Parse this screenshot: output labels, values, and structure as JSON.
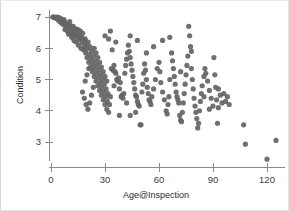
{
  "figure": {
    "background_color": "#ffffff",
    "border_color": "#dcdcdc",
    "width": 289,
    "height": 211
  },
  "axes": {
    "point_color": "#646464",
    "axis_color": "#8a8a8a",
    "label_color": "#2b2b2b",
    "x_title": "Age@Inspection",
    "y_title": "Condition"
  },
  "chart_data": {
    "type": "scatter",
    "title": "",
    "xlabel": "Age@Inspection",
    "ylabel": "Condition",
    "xlim": [
      -4,
      130
    ],
    "ylim": [
      2.3,
      7.25
    ],
    "xticks": [
      0,
      30,
      60,
      90,
      120
    ],
    "yticks": [
      3,
      4,
      5,
      6,
      7
    ],
    "xtick_labels": [
      "0",
      "30",
      "60",
      "90",
      "120"
    ],
    "ytick_labels": [
      "3",
      "4",
      "5",
      "6",
      "7"
    ],
    "grid": false,
    "legend": null,
    "marker": {
      "shape": "circle",
      "color": "#646464",
      "size_px": 5.2,
      "opacity": 0.92
    },
    "n_points": 231,
    "series": [
      {
        "name": "Bridge condition vs age",
        "points": [
          [
            1,
            7.0
          ],
          [
            1.5,
            7.0
          ],
          [
            2,
            6.98
          ],
          [
            2.5,
            7.0
          ],
          [
            3,
            6.95
          ],
          [
            3.5,
            7.0
          ],
          [
            4,
            6.9
          ],
          [
            4.5,
            6.98
          ],
          [
            5,
            6.85
          ],
          [
            5.5,
            6.95
          ],
          [
            6,
            6.8
          ],
          [
            6.5,
            6.88
          ],
          [
            7,
            6.75
          ],
          [
            7.2,
            6.92
          ],
          [
            7.8,
            6.6
          ],
          [
            8,
            6.82
          ],
          [
            8.5,
            6.7
          ],
          [
            9,
            6.55
          ],
          [
            9.3,
            6.78
          ],
          [
            9.8,
            6.45
          ],
          [
            10,
            6.65
          ],
          [
            10.4,
            6.85
          ],
          [
            10.8,
            6.5
          ],
          [
            11,
            6.72
          ],
          [
            11.5,
            6.35
          ],
          [
            11.8,
            6.6
          ],
          [
            12,
            6.45
          ],
          [
            12.4,
            6.7
          ],
          [
            12.8,
            6.25
          ],
          [
            13,
            6.55
          ],
          [
            13.3,
            6.4
          ],
          [
            13.8,
            6.62
          ],
          [
            14,
            6.2
          ],
          [
            14.3,
            6.48
          ],
          [
            14.8,
            6.35
          ],
          [
            15,
            6.6
          ],
          [
            15.3,
            6.1
          ],
          [
            15.7,
            6.42
          ],
          [
            16,
            6.28
          ],
          [
            16.3,
            6.55
          ],
          [
            16.7,
            6.0
          ],
          [
            17,
            6.35
          ],
          [
            17.3,
            6.18
          ],
          [
            17.6,
            6.48
          ],
          [
            18,
            5.95
          ],
          [
            18.3,
            6.25
          ],
          [
            18.6,
            6.05
          ],
          [
            19,
            6.3
          ],
          [
            19.3,
            5.85
          ],
          [
            19.6,
            6.12
          ],
          [
            20,
            5.7
          ],
          [
            20.3,
            5.98
          ],
          [
            20.6,
            6.2
          ],
          [
            21,
            5.55
          ],
          [
            21.3,
            5.8
          ],
          [
            21.6,
            6.05
          ],
          [
            22,
            5.4
          ],
          [
            22.3,
            5.65
          ],
          [
            22.6,
            5.9
          ],
          [
            23,
            5.25
          ],
          [
            23.3,
            5.5
          ],
          [
            23.6,
            5.75
          ],
          [
            24,
            5.1
          ],
          [
            24.3,
            5.35
          ],
          [
            24.6,
            5.6
          ],
          [
            25,
            4.95
          ],
          [
            25.3,
            5.2
          ],
          [
            25.6,
            5.45
          ],
          [
            26,
            4.8
          ],
          [
            26.3,
            5.05
          ],
          [
            26.6,
            5.3
          ],
          [
            27,
            4.65
          ],
          [
            27.3,
            4.9
          ],
          [
            27.6,
            5.15
          ],
          [
            28,
            4.5
          ],
          [
            28.3,
            4.75
          ],
          [
            28.6,
            5.0
          ],
          [
            29,
            4.35
          ],
          [
            29.3,
            4.6
          ],
          [
            29.6,
            4.85
          ],
          [
            30,
            4.2
          ],
          [
            30.3,
            4.45
          ],
          [
            30.6,
            4.7
          ],
          [
            31,
            4.05
          ],
          [
            31.3,
            4.3
          ],
          [
            31.6,
            4.55
          ],
          [
            32,
            3.95
          ],
          [
            32.5,
            4.2
          ],
          [
            33,
            4.45
          ],
          [
            17.5,
            4.6
          ],
          [
            18.5,
            4.4
          ],
          [
            19.5,
            4.2
          ],
          [
            20.5,
            4.05
          ],
          [
            21.5,
            4.25
          ],
          [
            22.5,
            4.5
          ],
          [
            23.5,
            4.75
          ],
          [
            19,
            4.95
          ],
          [
            20,
            5.15
          ],
          [
            21,
            5.35
          ],
          [
            24,
            6.0
          ],
          [
            25,
            5.85
          ],
          [
            26,
            5.7
          ],
          [
            27,
            5.55
          ],
          [
            28,
            5.4
          ],
          [
            29,
            5.25
          ],
          [
            30,
            5.1
          ],
          [
            31,
            4.95
          ],
          [
            32,
            6.3
          ],
          [
            33,
            6.55
          ],
          [
            34,
            5.95
          ],
          [
            35,
            5.45
          ],
          [
            36,
            5.2
          ],
          [
            37,
            4.95
          ],
          [
            38,
            4.7
          ],
          [
            39,
            4.45
          ],
          [
            33.5,
            5.35
          ],
          [
            34.5,
            5.3
          ],
          [
            35.5,
            5.25
          ],
          [
            36.5,
            5.0
          ],
          [
            37.5,
            5.05
          ],
          [
            38.5,
            4.9
          ],
          [
            39.5,
            4.5
          ],
          [
            40,
            4.4
          ],
          [
            40.5,
            4.55
          ],
          [
            41,
            5.2
          ],
          [
            41.5,
            5.45
          ],
          [
            42,
            5.65
          ],
          [
            42.5,
            5.85
          ],
          [
            43,
            6.1
          ],
          [
            43.5,
            5.9
          ],
          [
            44,
            5.7
          ],
          [
            44.5,
            5.5
          ],
          [
            45,
            5.3
          ],
          [
            45.5,
            5.1
          ],
          [
            46,
            4.9
          ],
          [
            46.5,
            4.7
          ],
          [
            47,
            4.5
          ],
          [
            47.5,
            4.45
          ],
          [
            48,
            4.3
          ],
          [
            48.5,
            4.2
          ],
          [
            49,
            4.15
          ],
          [
            49.5,
            3.55
          ],
          [
            50,
            3.55
          ],
          [
            44,
            3.85
          ],
          [
            38,
            3.85
          ],
          [
            50.5,
            4.6
          ],
          [
            51,
            4.85
          ],
          [
            51.5,
            5.2
          ],
          [
            52,
            5.5
          ],
          [
            52.5,
            5.3
          ],
          [
            53,
            5.0
          ],
          [
            53.5,
            4.75
          ],
          [
            54,
            4.55
          ],
          [
            54.5,
            4.35
          ],
          [
            55,
            4.3
          ],
          [
            55.5,
            4.2
          ],
          [
            56,
            4.45
          ],
          [
            57,
            4.7
          ],
          [
            58,
            5.0
          ],
          [
            59,
            5.35
          ],
          [
            60,
            5.55
          ],
          [
            60.5,
            5.25
          ],
          [
            61,
            4.9
          ],
          [
            62,
            4.6
          ],
          [
            63,
            4.35
          ],
          [
            64,
            4.0
          ],
          [
            64.5,
            3.9
          ],
          [
            65,
            4.2
          ],
          [
            65.5,
            4.45
          ],
          [
            66,
            6.35
          ],
          [
            67,
            5.85
          ],
          [
            67.5,
            5.6
          ],
          [
            68,
            5.35
          ],
          [
            68.5,
            5.1
          ],
          [
            69,
            4.85
          ],
          [
            69.5,
            4.6
          ],
          [
            70,
            4.45
          ],
          [
            70.5,
            4.35
          ],
          [
            71,
            4.25
          ],
          [
            71.5,
            3.85
          ],
          [
            72,
            3.7
          ],
          [
            72.5,
            3.65
          ],
          [
            73,
            3.95
          ],
          [
            73.5,
            4.25
          ],
          [
            74,
            4.55
          ],
          [
            74.5,
            4.85
          ],
          [
            75,
            5.15
          ],
          [
            75.5,
            5.45
          ],
          [
            76,
            5.75
          ],
          [
            76.5,
            6.7
          ],
          [
            77,
            6.4
          ],
          [
            77.5,
            6.05
          ],
          [
            78,
            5.35
          ],
          [
            78.5,
            5.0
          ],
          [
            79,
            4.7
          ],
          [
            79.5,
            4.4
          ],
          [
            80,
            4.15
          ],
          [
            80.5,
            3.95
          ],
          [
            81,
            3.75
          ],
          [
            81.5,
            3.45
          ],
          [
            82,
            3.6
          ],
          [
            82.5,
            4.0
          ],
          [
            83,
            4.3
          ],
          [
            83.5,
            4.55
          ],
          [
            84,
            4.8
          ],
          [
            85,
            5.1
          ],
          [
            85.5,
            5.35
          ],
          [
            86,
            5.2
          ],
          [
            87,
            4.95
          ],
          [
            88,
            4.65
          ],
          [
            89,
            4.4
          ],
          [
            90,
            4.15
          ],
          [
            90.5,
            5.7
          ],
          [
            91,
            5.15
          ],
          [
            91.5,
            4.75
          ],
          [
            92,
            4.35
          ],
          [
            92.5,
            3.6
          ],
          [
            93,
            4.1
          ],
          [
            94,
            4.5
          ],
          [
            95,
            4.25
          ],
          [
            96,
            4.55
          ],
          [
            97,
            4.3
          ],
          [
            98,
            4.45
          ],
          [
            99,
            4.2
          ],
          [
            107,
            3.55
          ],
          [
            108,
            2.93
          ],
          [
            120,
            2.45
          ],
          [
            125,
            3.05
          ],
          [
            62,
            6.25
          ],
          [
            57,
            6.05
          ],
          [
            48,
            6.25
          ],
          [
            36,
            6.2
          ],
          [
            30,
            6.4
          ],
          [
            44,
            6.4
          ],
          [
            53,
            5.85
          ],
          [
            66,
            5.0
          ],
          [
            72,
            5.25
          ],
          [
            78,
            5.9
          ],
          [
            85,
            4.45
          ],
          [
            88,
            4.05
          ],
          [
            93,
            4.7
          ],
          [
            35,
            4.8
          ],
          [
            42,
            4.25
          ],
          [
            47,
            3.95
          ]
        ]
      }
    ]
  }
}
